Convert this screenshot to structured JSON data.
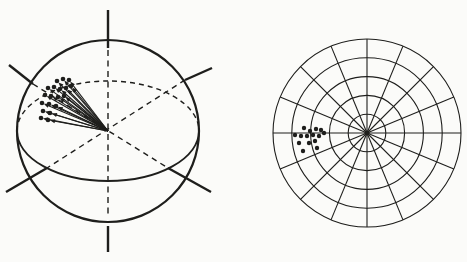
{
  "figure": {
    "background": "#fbfbf9",
    "ink": "#1e1e1c"
  },
  "sphere_diagram": {
    "center": {
      "x": 108,
      "y": 131
    },
    "radius": 91,
    "equator": {
      "rx": 91,
      "ry": 50,
      "front_style": "solid",
      "back_style": "dashed"
    },
    "vertical_axis": {
      "top_solid": {
        "x1": 108,
        "y1": 10,
        "x2": 108,
        "y2": 48
      },
      "inner_dashed": {
        "x1": 108,
        "y1": 50,
        "x2": 108,
        "y2": 214
      },
      "bottom_solid": {
        "x1": 108,
        "y1": 226,
        "x2": 108,
        "y2": 252
      }
    },
    "diagonal_axes": {
      "solid_segments": [
        {
          "x1": 9,
          "y1": 65,
          "x2": 33,
          "y2": 84
        },
        {
          "x1": 185,
          "y1": 80,
          "x2": 212,
          "y2": 68
        },
        {
          "x1": 6,
          "y1": 192,
          "x2": 47,
          "y2": 168
        },
        {
          "x1": 168,
          "y1": 168,
          "x2": 211,
          "y2": 192
        }
      ],
      "dashed_segments": [
        {
          "x1": 33,
          "y1": 84,
          "x2": 168,
          "y2": 168
        },
        {
          "x1": 185,
          "y1": 80,
          "x2": 47,
          "y2": 168
        }
      ]
    },
    "vector_origin": {
      "x": 108,
      "y": 131
    },
    "vector_tips": [
      [
        57,
        81
      ],
      [
        63,
        79
      ],
      [
        69,
        80
      ],
      [
        48,
        88
      ],
      [
        54,
        87
      ],
      [
        60,
        89
      ],
      [
        66,
        88
      ],
      [
        71,
        86
      ],
      [
        45,
        95
      ],
      [
        51,
        96
      ],
      [
        58,
        97
      ],
      [
        64,
        96
      ],
      [
        42,
        103
      ],
      [
        49,
        104
      ],
      [
        56,
        106
      ],
      [
        43,
        111
      ],
      [
        50,
        113
      ],
      [
        41,
        118
      ],
      [
        48,
        120
      ]
    ],
    "dot_radius": 2.3,
    "stroke_widths": {
      "outline": 2.2,
      "equator": 1.8,
      "axis_solid": 2.4,
      "axis_dashed": 1.4,
      "arrow": 1.1
    }
  },
  "polar_diagram": {
    "center": {
      "x": 367,
      "y": 133
    },
    "outer_radius": 94,
    "ring_count": 5,
    "spoke_count": 16,
    "spoke_step_degrees": 22.5,
    "points": [
      [
        304,
        128
      ],
      [
        310,
        131
      ],
      [
        316,
        129
      ],
      [
        321,
        130
      ],
      [
        295,
        135
      ],
      [
        301,
        136
      ],
      [
        307,
        136
      ],
      [
        313,
        135
      ],
      [
        319,
        136
      ],
      [
        324,
        133
      ],
      [
        299,
        143
      ],
      [
        309,
        143
      ],
      [
        315,
        141
      ],
      [
        317,
        148
      ],
      [
        303,
        151
      ]
    ],
    "dot_radius": 2.2,
    "center_dot_radius": 2.5,
    "stroke_widths": {
      "grid": 1.1
    }
  }
}
